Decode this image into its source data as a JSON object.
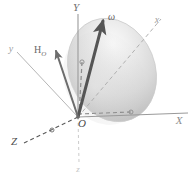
{
  "figure": {
    "background_color": "#ffffff",
    "body": {
      "name": "ellipsoid",
      "fill_light": "#f4f4f4",
      "fill_mid": "#d8d8d8",
      "fill_dark": "#b8b8b8",
      "outline_color": "#c9c9c9"
    },
    "origin": {
      "label": "O",
      "x": 78,
      "y": 117
    },
    "fixed_axes": [
      {
        "id": "Y",
        "label": "Y",
        "style": "solid",
        "color": "#9a9a9a",
        "label_x": 76,
        "label_y": 5,
        "tip_x": 78,
        "tip_y": 14
      },
      {
        "id": "X",
        "label": "X",
        "style": "solid",
        "color": "#9a9a9a",
        "label_x": 178,
        "label_y": 118,
        "tip_x": 188,
        "tip_y": 113
      },
      {
        "id": "Z",
        "label": "Z",
        "style": "dashed",
        "color": "#5a5a5a",
        "label_x": 15,
        "label_y": 138,
        "tip_x": 24,
        "tip_y": 143
      }
    ],
    "body_axes": [
      {
        "id": "x",
        "label": "x",
        "style": "dashed",
        "color": "#b0b0b0",
        "label_x": 153,
        "label_y": 22,
        "tip_x": 163,
        "tip_y": 18
      },
      {
        "id": "y",
        "label": "y",
        "style": "solid",
        "color": "#b6b6b6",
        "label_x": 9,
        "label_y": 48,
        "tip_x": 18,
        "tip_y": 52
      },
      {
        "id": "z",
        "label": "z",
        "style": "dashed",
        "color": "#cccccc",
        "label_x": 76,
        "label_y": 168,
        "tip_x": 79,
        "tip_y": 162
      }
    ],
    "vectors": [
      {
        "id": "omega",
        "label": "ω",
        "description": "angular-velocity-vector",
        "color": "#555555",
        "thickness": 3,
        "from_x": 78,
        "from_y": 117,
        "to_x": 102,
        "to_y": 20,
        "label_x": 108,
        "label_y": 16
      },
      {
        "id": "H_O",
        "label": "H",
        "subscript": "O",
        "description": "angular-momentum-vector",
        "color": "#6d6d6d",
        "thickness": 2,
        "from_x": 78,
        "from_y": 117,
        "to_x": 55,
        "to_y": 50,
        "label_x": 37,
        "label_y": 50
      }
    ],
    "construction_lines": [
      {
        "id": "vertical-dashed",
        "description": "projection line from omega tip down to origin along Y",
        "style": "dashed",
        "color": "#8c8c8c"
      },
      {
        "id": "x-projection-dashed",
        "description": "projection of body x axis onto horizontal plane",
        "style": "dashed",
        "color": "#8c8c8c"
      }
    ]
  }
}
